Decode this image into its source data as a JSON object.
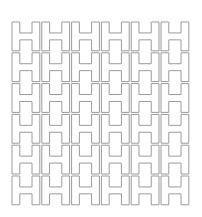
{
  "figure": {
    "stroke_color": "#9a9a9a",
    "background": "#ffffff",
    "grid": {
      "cols": 6,
      "rows": 6,
      "x0": 12,
      "y0": 22,
      "cell_w": 29.8,
      "cell_h": 30.8
    }
  }
}
